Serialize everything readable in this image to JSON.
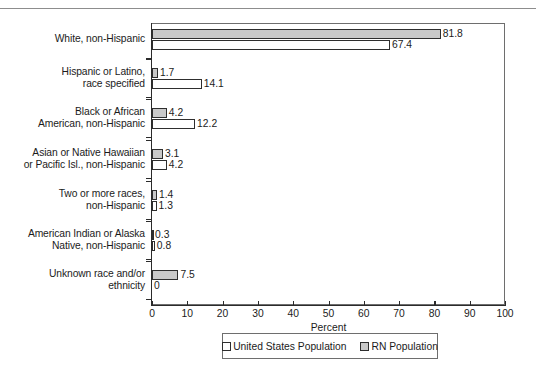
{
  "title_strip": {
    "ghost_text": "",
    "divider": "horizontal-rule"
  },
  "chart_data": {
    "type": "bar",
    "orientation": "horizontal",
    "title": "",
    "xlabel": "Percent",
    "ylabel": "",
    "xlim": [
      0,
      100
    ],
    "xticks": [
      0,
      10,
      20,
      30,
      40,
      50,
      60,
      70,
      80,
      90,
      100
    ],
    "grid": false,
    "legend_position": "bottom-center",
    "categories": [
      "White, non-Hispanic",
      "Hispanic or Latino, race specified",
      "Black or African American, non-Hispanic",
      "Asian or Native Hawaiian or Pacific Isl., non-Hispanic",
      "Two or more races, non-Hispanic",
      "American Indian or Alaska Native, non-Hispanic",
      "Unknown race and/or ethnicity"
    ],
    "category_lines": [
      [
        "White, non-Hispanic"
      ],
      [
        "Hispanic or Latino,",
        "race specified"
      ],
      [
        "Black or African",
        "American, non-Hispanic"
      ],
      [
        "Asian or Native Hawaiian",
        "or Pacific Isl., non-Hispanic"
      ],
      [
        "Two or more races,",
        "non-Hispanic"
      ],
      [
        "American Indian or Alaska",
        "Native, non-Hispanic"
      ],
      [
        "Unknown race and/or",
        "ethnicity"
      ]
    ],
    "series": [
      {
        "name": "RN Population",
        "color": "#c9c9c9",
        "values": [
          81.8,
          1.7,
          4.2,
          3.1,
          1.4,
          0.3,
          7.5
        ],
        "labels": [
          "81.8",
          "1.7",
          "4.2",
          "3.1",
          "1.4",
          "0.3",
          "7.5"
        ]
      },
      {
        "name": "United States Population",
        "color": "#ffffff",
        "values": [
          67.4,
          14.1,
          12.2,
          4.2,
          1.3,
          0.8,
          0.0
        ],
        "labels": [
          "67.4",
          "14.1",
          "12.2",
          "4.2",
          "1.3",
          "0.8",
          "0"
        ]
      }
    ]
  },
  "legend": {
    "items": [
      {
        "label": "United States Population",
        "swatch": "white-square"
      },
      {
        "label": "RN Population",
        "swatch": "gray-square"
      }
    ]
  },
  "colors": {
    "rn_fill": "#c9c9c9",
    "us_fill": "#ffffff",
    "outline": "#2e2e2e",
    "axis": "#2b2b2b",
    "frame": "#6e6e6e"
  }
}
